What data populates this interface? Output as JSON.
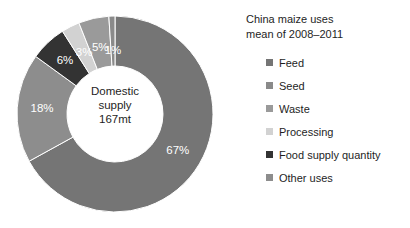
{
  "chart_data": {
    "type": "pie",
    "variant": "donut",
    "title": "China maize uses",
    "subtitle": "mean of 2008–2011",
    "xlabel": "",
    "ylabel": "",
    "legend_position": "right",
    "grid": false,
    "center_label": {
      "line1": "Domestic",
      "line2": "supply",
      "line3": "167mt"
    },
    "total_label": "167mt",
    "units": "percent of domestic supply",
    "categories": [
      "Feed",
      "Seed",
      "Waste",
      "Processing",
      "Food supply quantity",
      "Other uses"
    ],
    "values": [
      67,
      1,
      5,
      3,
      6,
      18
    ],
    "data_labels": [
      "67%",
      "1%",
      "5%",
      "3%",
      "6%",
      "18%"
    ],
    "colors": [
      "#757575",
      "#8a8a8a",
      "#9a9a9a",
      "#d2d2d2",
      "#333333",
      "#8d8d8d"
    ],
    "slices": [
      {
        "label": "Feed",
        "value": 67,
        "display": "67%",
        "color": "#757575",
        "label_color": "#ffffff"
      },
      {
        "label": "Other uses",
        "value": 18,
        "display": "18%",
        "color": "#8d8d8d",
        "label_color": "#ffffff"
      },
      {
        "label": "Food supply quantity",
        "value": 6,
        "display": "6%",
        "color": "#333333",
        "label_color": "#ffffff"
      },
      {
        "label": "Processing",
        "value": 3,
        "display": "3%",
        "color": "#d2d2d2",
        "label_color": "#ffffff"
      },
      {
        "label": "Waste",
        "value": 5,
        "display": "5%",
        "color": "#9a9a9a",
        "label_color": "#ffffff"
      },
      {
        "label": "Seed",
        "value": 1,
        "display": "1%",
        "color": "#8a8a8a",
        "label_color": "#ffffff"
      }
    ]
  },
  "legend": {
    "title_line1": "China maize uses",
    "title_line2": "mean of 2008–2011",
    "items": [
      {
        "label": "Feed",
        "color": "#757575"
      },
      {
        "label": "Seed",
        "color": "#8a8a8a"
      },
      {
        "label": "Waste",
        "color": "#9a9a9a"
      },
      {
        "label": "Processing",
        "color": "#d2d2d2"
      },
      {
        "label": "Food supply quantity",
        "color": "#333333"
      },
      {
        "label": "Other uses",
        "color": "#8d8d8d"
      }
    ]
  },
  "center": {
    "line1": "Domestic",
    "line2": "supply",
    "line3": "167mt"
  },
  "labels": {
    "feed": "67%",
    "other_uses": "18%",
    "food_supply_quantity": "6%",
    "processing": "3%",
    "waste": "5%",
    "seed": "1%"
  }
}
